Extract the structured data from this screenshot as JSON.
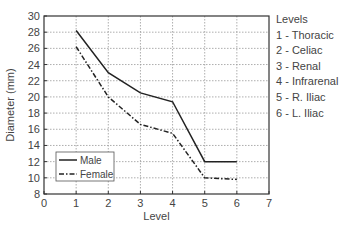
{
  "chart_data": {
    "type": "line",
    "title": "",
    "xlabel": "Level",
    "ylabel": "Diameter (mm)",
    "xlim": [
      0,
      7
    ],
    "ylim": [
      8,
      30
    ],
    "xticks": [
      0,
      1,
      2,
      3,
      4,
      5,
      6,
      7
    ],
    "yticks": [
      8,
      10,
      12,
      14,
      16,
      18,
      20,
      22,
      24,
      26,
      28,
      30
    ],
    "grid": true,
    "legend_position": "lower left",
    "x": [
      1,
      2,
      3,
      4,
      5,
      6
    ],
    "series": [
      {
        "name": "Male",
        "style": "solid",
        "values": [
          28.2,
          23.0,
          20.5,
          19.4,
          12.0,
          12.0
        ]
      },
      {
        "name": "Female",
        "style": "dash-dot",
        "values": [
          26.2,
          20.0,
          16.6,
          15.5,
          10.0,
          9.8
        ]
      }
    ],
    "annotation": {
      "title": "Levels",
      "items": [
        "1 - Thoracic",
        "2 - Celiac",
        "3 - Renal",
        "4 - Infrarenal",
        "5 - R. Iliac",
        "6 - L. Iliac"
      ]
    }
  },
  "colors": {
    "axis": "#333333",
    "grid": "#999999",
    "line": "#222222"
  }
}
